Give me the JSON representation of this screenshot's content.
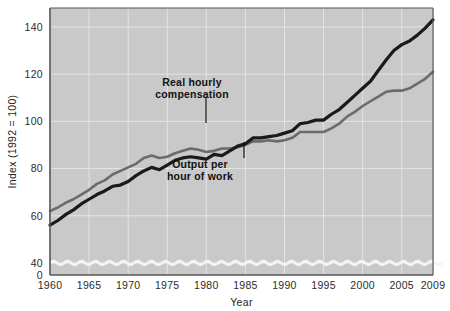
{
  "chart_data": {
    "type": "line",
    "title": "",
    "xlabel": "Year",
    "ylabel": "Index (1992 = 100)",
    "xlim": [
      1960,
      2009
    ],
    "ylim": [
      0,
      148
    ],
    "y_axis_break": true,
    "y_break_note": "wavy break between 0 and 40",
    "grid": true,
    "legend_position": "inline-annotations",
    "xticks": [
      "1960",
      "1965",
      "1970",
      "1975",
      "1980",
      "1985",
      "1990",
      "1995",
      "2000",
      "2005",
      "2009"
    ],
    "xtick_values": [
      1960,
      1965,
      1970,
      1975,
      1980,
      1985,
      1990,
      1995,
      2000,
      2005,
      2009
    ],
    "yticks": [
      "0",
      "40",
      "60",
      "80",
      "100",
      "120",
      "140"
    ],
    "ytick_values": [
      0,
      40,
      60,
      80,
      100,
      120,
      140
    ],
    "x": [
      1960,
      1961,
      1962,
      1963,
      1964,
      1965,
      1966,
      1967,
      1968,
      1969,
      1970,
      1971,
      1972,
      1973,
      1974,
      1975,
      1976,
      1977,
      1978,
      1979,
      1980,
      1981,
      1982,
      1983,
      1984,
      1985,
      1986,
      1987,
      1988,
      1989,
      1990,
      1991,
      1992,
      1993,
      1994,
      1995,
      1996,
      1997,
      1998,
      1999,
      2000,
      2001,
      2002,
      2003,
      2004,
      2005,
      2006,
      2007,
      2008,
      2009
    ],
    "series": [
      {
        "name": "Real hourly compensation",
        "color": "#6b6b6b",
        "width": 2.6,
        "values": [
          62,
          63.5,
          65.5,
          67,
          69,
          71,
          73.5,
          75,
          77.5,
          79,
          80.5,
          82,
          84.5,
          85.5,
          84.5,
          85,
          86.5,
          87.5,
          88.5,
          88,
          87,
          87.5,
          88.5,
          88.5,
          89,
          90,
          91.5,
          91.5,
          92,
          91.5,
          92,
          93,
          95.5,
          95.5,
          95.5,
          95.5,
          97,
          99,
          102,
          104,
          106.5,
          108.5,
          110.5,
          112.5,
          113,
          113,
          114,
          116,
          118,
          121
        ]
      },
      {
        "name": "Output per hour of work",
        "color": "#1a1a1a",
        "width": 3.2,
        "values": [
          56,
          58,
          60.5,
          62.5,
          65,
          67,
          69,
          70.5,
          72.5,
          73,
          74.5,
          77,
          79,
          80.5,
          79.5,
          81.5,
          83.5,
          84.5,
          85,
          84.5,
          84,
          86,
          85.5,
          87.5,
          89.5,
          90.5,
          93,
          93,
          93.5,
          94,
          95,
          96,
          99,
          99.5,
          100.5,
          100.5,
          103,
          105,
          108,
          111,
          114,
          117,
          121.5,
          126,
          130,
          132.5,
          134,
          136.5,
          139.5,
          143
        ]
      }
    ],
    "annotations": [
      {
        "text_line1": "Real hourly",
        "text_line2": "compensation",
        "label_x": 192,
        "label_y": 86,
        "leader_x": 206,
        "leader_y1": 97,
        "leader_y2": 123
      },
      {
        "text_line1": "Output per",
        "text_line2": "hour of work",
        "label_x": 200,
        "label_y": 168,
        "leader_x": 244,
        "leader_y1": 158,
        "leader_y2": 142
      }
    ]
  },
  "colors": {
    "plot_background": "#c9c9c9",
    "page_background": "#ffffff",
    "gridline": "#e4e4e4",
    "axis_line": "#555555",
    "break_line": "#f4f4f4",
    "compensation": "#6b6b6b",
    "output": "#1a1a1a",
    "text": "#1c1c1c"
  }
}
